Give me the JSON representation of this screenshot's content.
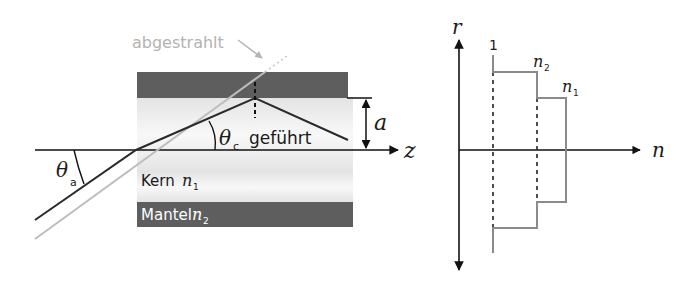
{
  "left_diagram": {
    "title": "Step-index fiber ray guidance",
    "radiated_label": "abgestrahlt",
    "guided_label": "geführt",
    "core_label": "Kern",
    "core_index": "n",
    "core_index_sub": "1",
    "cladding_label": "Mantel",
    "cladding_index": "n",
    "cladding_index_sub": "2",
    "acceptance_angle": "θ",
    "acceptance_angle_sub": "a",
    "critical_angle": "θ",
    "critical_angle_sub": "c",
    "radius_label": "a",
    "axis_label": "z"
  },
  "right_diagram": {
    "title": "Refractive index profile",
    "vertical_axis_label": "r",
    "horizontal_axis_label": "n",
    "level_air": "1",
    "level_cladding": "n",
    "level_cladding_sub": "2",
    "level_core": "n",
    "level_core_sub": "1"
  },
  "colors": {
    "cladding": "#5c5c5c",
    "core_gradient_top": "#e6e6e6",
    "core_gradient_mid": "#f7f7f7",
    "ray_dark": "#2a2a2a",
    "ray_grey": "#b8b8b8",
    "profile_line": "#8a8a8a",
    "axis": "#111111"
  }
}
